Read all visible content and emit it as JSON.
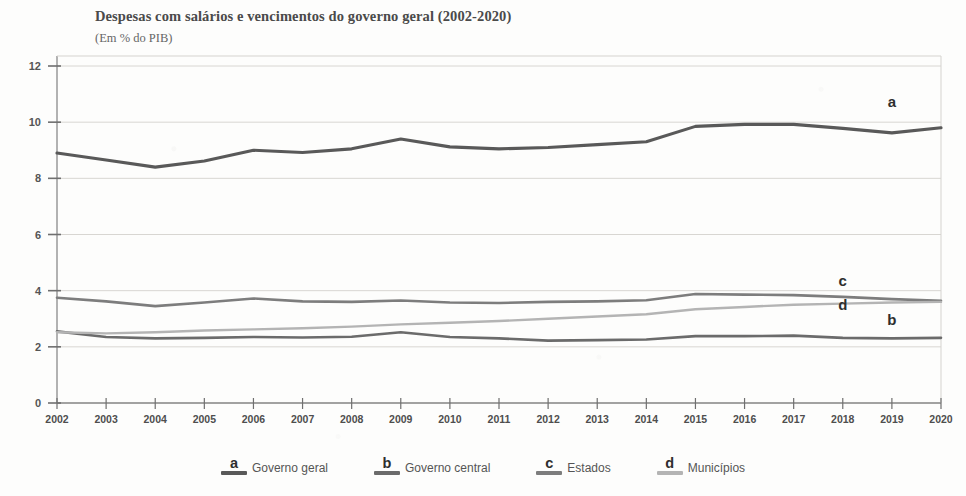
{
  "header": {
    "title": "Despesas com salários e vencimentos do governo geral (2002-2020)",
    "subtitle": "(Em % do PIB)"
  },
  "legend": {
    "items": [
      {
        "letter": "a",
        "label": "Governo geral",
        "color": "#595959"
      },
      {
        "letter": "b",
        "label": "Governo central",
        "color": "#6b6b6b"
      },
      {
        "letter": "c",
        "label": "Estados",
        "color": "#7d7d7d"
      },
      {
        "letter": "d",
        "label": "Municípios",
        "color": "#b4b4b4"
      }
    ]
  },
  "chart_data": {
    "type": "line",
    "title": "Despesas com salários e vencimentos do governo geral (2002-2020)",
    "subtitle": "(Em % do PIB)",
    "xlabel": "",
    "ylabel": "",
    "ylim": [
      0,
      12
    ],
    "yticks": [
      0,
      2,
      4,
      6,
      8,
      10,
      12
    ],
    "grid": true,
    "legend_position": "bottom",
    "categories": [
      "2002",
      "2003",
      "2004",
      "2005",
      "2006",
      "2007",
      "2008",
      "2009",
      "2010",
      "2011",
      "2012",
      "2013",
      "2014",
      "2015",
      "2016",
      "2017",
      "2018",
      "2019",
      "2020"
    ],
    "series": [
      {
        "name": "Governo geral",
        "letter": "a",
        "color": "#595959",
        "width": 3.1,
        "values": [
          8.9,
          8.65,
          8.4,
          8.62,
          9.0,
          8.92,
          9.05,
          9.4,
          9.12,
          9.05,
          9.1,
          9.2,
          9.3,
          9.85,
          9.92,
          9.92,
          9.78,
          9.62,
          9.8
        ]
      },
      {
        "name": "Governo central",
        "letter": "b",
        "color": "#6b6b6b",
        "width": 2.6,
        "values": [
          2.55,
          2.35,
          2.3,
          2.32,
          2.35,
          2.33,
          2.36,
          2.52,
          2.35,
          2.3,
          2.22,
          2.24,
          2.26,
          2.38,
          2.38,
          2.4,
          2.32,
          2.3,
          2.32
        ]
      },
      {
        "name": "Estados",
        "letter": "c",
        "color": "#7d7d7d",
        "width": 2.6,
        "values": [
          3.75,
          3.62,
          3.45,
          3.58,
          3.72,
          3.62,
          3.6,
          3.65,
          3.58,
          3.56,
          3.6,
          3.62,
          3.66,
          3.88,
          3.86,
          3.84,
          3.78,
          3.7,
          3.64
        ]
      },
      {
        "name": "Municípios",
        "letter": "d",
        "color": "#b4b4b4",
        "width": 2.4,
        "values": [
          2.52,
          2.48,
          2.52,
          2.58,
          2.62,
          2.66,
          2.72,
          2.8,
          2.86,
          2.92,
          3.0,
          3.08,
          3.16,
          3.34,
          3.42,
          3.5,
          3.54,
          3.58,
          3.6
        ]
      }
    ],
    "annotations": [
      {
        "text": "a",
        "x": "2019",
        "y": 10.55
      },
      {
        "text": "b",
        "x": "2019",
        "y": 2.78
      },
      {
        "text": "c",
        "x": "2018",
        "y": 4.18
      },
      {
        "text": "d",
        "x": "2018",
        "y": 3.3
      }
    ]
  }
}
